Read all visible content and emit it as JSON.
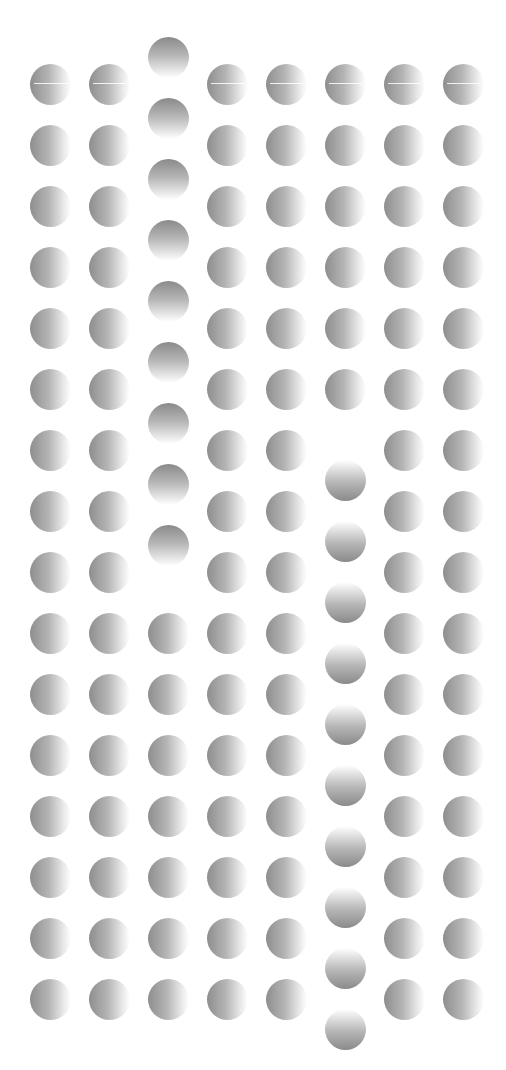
{
  "illusion": {
    "columns": 8,
    "rows": 16,
    "col_centers": [
      50,
      109,
      168,
      227,
      286,
      345,
      404,
      463
    ],
    "row_start": 84,
    "row_step": 61,
    "dot_diameter": 41,
    "background": "#ffffff",
    "dot_dark": "#8a8a8a",
    "dot_light": "#ffffff",
    "default_gradient": "left-dark",
    "special_columns": [
      {
        "column": 2,
        "rows_from": 0,
        "rows_to": 8,
        "gradient": "top-dark",
        "offset_y": -27
      },
      {
        "column": 5,
        "rows_from": 6,
        "rows_to": 15,
        "gradient": "bottom-dark",
        "offset_y": 30
      }
    ],
    "glint_row": 0
  }
}
